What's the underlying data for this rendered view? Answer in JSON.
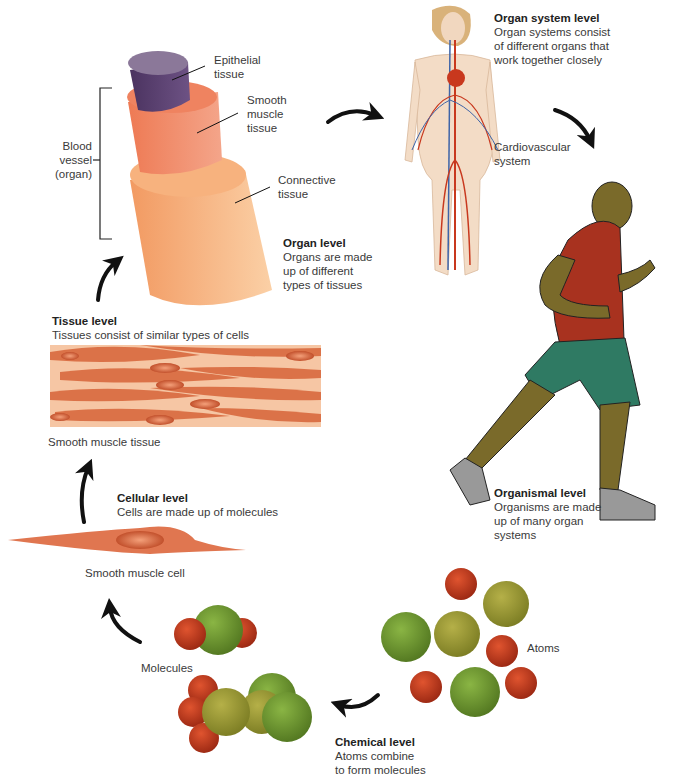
{
  "levels": {
    "chemical": {
      "title": "Chemical level",
      "desc1": "Atoms combine",
      "desc2": "to form molecules"
    },
    "cellular": {
      "title": "Cellular level",
      "desc": "Cells are made up of molecules"
    },
    "tissue": {
      "title": "Tissue level",
      "desc": "Tissues consist of similar types of cells"
    },
    "organ": {
      "title": "Organ level",
      "desc1": "Organs are made",
      "desc2": "up of different",
      "desc3": "types of tissues"
    },
    "organ_system": {
      "title": "Organ system level",
      "desc1": "Organ systems consist",
      "desc2": "of different organs that",
      "desc3": "work together closely"
    },
    "organismal": {
      "title": "Organismal level",
      "desc1": "Organisms are made",
      "desc2": "up of many organ",
      "desc3": "systems"
    }
  },
  "labels": {
    "atoms": "Atoms",
    "molecules": "Molecules",
    "smooth_muscle_cell": "Smooth muscle cell",
    "smooth_muscle_tissue": "Smooth muscle tissue",
    "epithelial_1": "Epithelial",
    "epithelial_2": "tissue",
    "smooth_1": "Smooth",
    "smooth_2": "muscle",
    "smooth_3": "tissue",
    "connective_1": "Connective",
    "connective_2": "tissue",
    "blood_1": "Blood",
    "blood_2": "vessel",
    "blood_3": "(organ)",
    "cardio_1": "Cardiovascular",
    "cardio_2": "system"
  },
  "colors": {
    "arrow": "#111111",
    "atom_red": "#c0391e",
    "atom_green": "#6f9a2e",
    "atom_olive": "#9a9a35",
    "epithelial": "#5a3f6e",
    "smooth_muscle": "#f08a68",
    "connective": "#f7b27e",
    "shirt": "#a8321f",
    "shorts": "#2f7a63",
    "skin": "#7a6a2a"
  }
}
